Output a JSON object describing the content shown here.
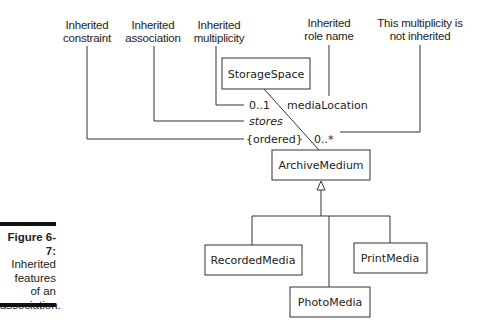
{
  "annotations": {
    "inherited_constraint": [
      "Inherited",
      "constraint"
    ],
    "inherited_association": [
      "Inherited",
      "association"
    ],
    "inherited_multiplicity": [
      "Inherited",
      "multiplicity"
    ],
    "inherited_role_name": [
      "Inherited",
      "role name"
    ],
    "not_inherited_multiplicity": [
      "This multiplicity is",
      "not inherited"
    ]
  },
  "classes": {
    "storage_space": "StorageSpace",
    "archive_medium": "ArchiveMedium",
    "recorded_media": "RecordedMedia",
    "photo_media": "PhotoMedia",
    "print_media": "PrintMedia"
  },
  "association": {
    "storage_multiplicity": "0..1",
    "role_name": "mediaLocation",
    "name": "stores",
    "constraint": "{ordered}",
    "medium_multiplicity": "0..*"
  },
  "caption": {
    "label": "Figure 6-7:",
    "lines": [
      "Inherited",
      "features",
      "of an",
      "association."
    ]
  }
}
